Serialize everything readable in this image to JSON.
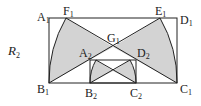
{
  "figure": {
    "label": "R",
    "label_sub": "2",
    "fill_color": "#d3d3d3",
    "stroke_color": "#222222",
    "points": [
      {
        "name": "A",
        "sub": "1"
      },
      {
        "name": "F",
        "sub": "1"
      },
      {
        "name": "E",
        "sub": "1"
      },
      {
        "name": "D",
        "sub": "1"
      },
      {
        "name": "G",
        "sub": "1"
      },
      {
        "name": "A",
        "sub": "2"
      },
      {
        "name": "D",
        "sub": "2"
      },
      {
        "name": "B",
        "sub": "1"
      },
      {
        "name": "B",
        "sub": "2"
      },
      {
        "name": "C",
        "sub": "2"
      },
      {
        "name": "C",
        "sub": "1"
      }
    ]
  }
}
